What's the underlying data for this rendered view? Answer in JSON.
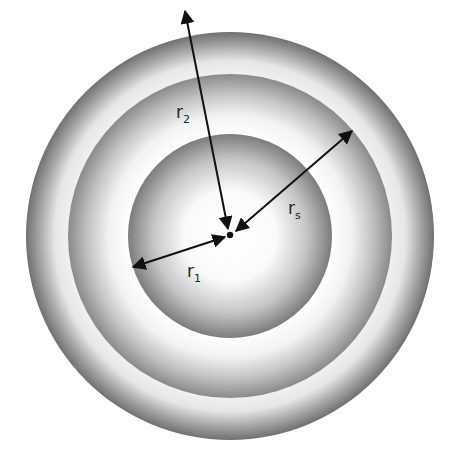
{
  "diagram": {
    "center": {
      "x": 230,
      "y": 236
    },
    "shells": [
      {
        "name": "outer-shell",
        "radius": 204
      },
      {
        "name": "middle-shell",
        "radius": 162
      },
      {
        "name": "inner-sphere",
        "radius": 102
      }
    ],
    "labels": {
      "r1": {
        "base": "r",
        "sub": "1"
      },
      "r2": {
        "base": "r",
        "sub": "2"
      },
      "rs": {
        "base": "r",
        "sub": "s"
      }
    },
    "colors": {
      "shade_dark": "#6e6e6e",
      "shade_light": "#ffffff",
      "arrow": "#111111"
    }
  }
}
